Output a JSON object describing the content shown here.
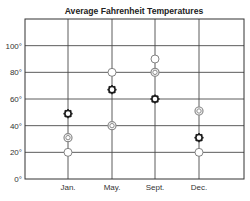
{
  "chart_data": {
    "type": "scatter",
    "title": "Average Fahrenheit Temperatures",
    "xlabel": "",
    "ylabel": "",
    "categories": [
      "Jan.",
      "May.",
      "Sept.",
      "Dec."
    ],
    "y_ticks": [
      "0°",
      "20°",
      "40°",
      "60°",
      "80°",
      "100°"
    ],
    "y_tick_values": [
      0,
      20,
      40,
      60,
      80,
      100
    ],
    "ylim": [
      0,
      120
    ],
    "grid": true,
    "legend": null,
    "series": [
      {
        "name": "white-circle",
        "marker": "open-circle",
        "values": [
          20,
          80,
          90,
          20
        ]
      },
      {
        "name": "gray-ring",
        "marker": "double-ring",
        "values": [
          31,
          40,
          80,
          51
        ]
      },
      {
        "name": "dark-gear",
        "marker": "dark-sun",
        "values": [
          49,
          67,
          60,
          31
        ]
      }
    ]
  },
  "colors": {
    "grid": "#4a4a4a",
    "border": "#333333",
    "white_marker_stroke": "#777777",
    "gray_marker_stroke": "#8a8a8a",
    "dark_marker": "#1a1a1a"
  }
}
